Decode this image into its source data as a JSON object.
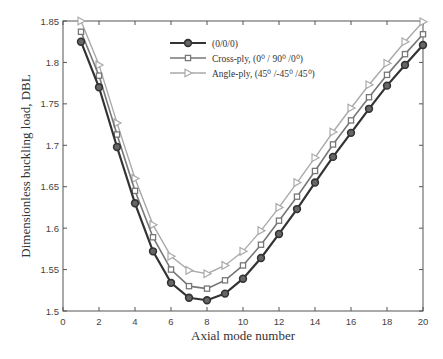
{
  "chart_data": {
    "type": "line",
    "title": "",
    "xlabel": "Axial mode number",
    "ylabel": "Dimensionless buckling load, DBL",
    "xlim": [
      0,
      20
    ],
    "ylim": [
      1.5,
      1.85
    ],
    "xticks": [
      0,
      2,
      4,
      6,
      8,
      10,
      12,
      14,
      16,
      18,
      20
    ],
    "yticks": [
      1.5,
      1.55,
      1.6,
      1.65,
      1.7,
      1.75,
      1.8,
      1.85
    ],
    "grid": false,
    "legend_position": "upper center",
    "x": [
      1,
      2,
      3,
      4,
      5,
      6,
      7,
      8,
      9,
      10,
      11,
      12,
      13,
      14,
      15,
      16,
      17,
      18,
      19,
      20
    ],
    "series": [
      {
        "name": "(0/0/0)",
        "color": "#333333",
        "marker": "circle-filled",
        "values": [
          1.825,
          1.77,
          1.698,
          1.63,
          1.572,
          1.534,
          1.516,
          1.513,
          1.521,
          1.539,
          1.564,
          1.593,
          1.623,
          1.655,
          1.686,
          1.715,
          1.744,
          1.772,
          1.797,
          1.821
        ]
      },
      {
        "name": "Cross-ply, (0⁰ / 90⁰ /0⁰)",
        "color": "#777777",
        "marker": "square",
        "values": [
          1.837,
          1.784,
          1.713,
          1.645,
          1.589,
          1.55,
          1.53,
          1.527,
          1.537,
          1.555,
          1.58,
          1.609,
          1.638,
          1.669,
          1.701,
          1.73,
          1.758,
          1.785,
          1.81,
          1.834
        ]
      },
      {
        "name": "Angle-ply, (45⁰ /-45⁰ /45⁰)",
        "color": "#aaaaaa",
        "marker": "triangle-right",
        "values": [
          1.85,
          1.797,
          1.727,
          1.66,
          1.604,
          1.566,
          1.549,
          1.545,
          1.555,
          1.572,
          1.597,
          1.625,
          1.655,
          1.685,
          1.716,
          1.745,
          1.773,
          1.799,
          1.825,
          1.849
        ]
      }
    ]
  },
  "legend": {
    "items": [
      {
        "label_main": "(0/0/0)",
        "label_sup": ""
      },
      {
        "label_main": "Cross-ply, (0⁰ / 90⁰ /0⁰)"
      },
      {
        "label_main": "Angle-ply, (45⁰ /-45⁰ /45⁰)"
      }
    ]
  }
}
